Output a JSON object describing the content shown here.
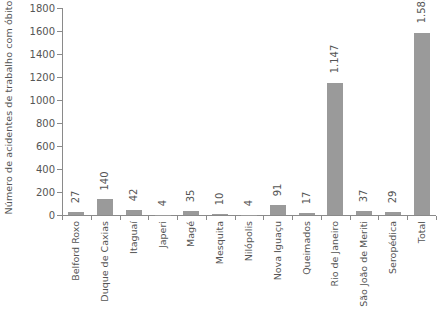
{
  "chart_data": {
    "type": "bar",
    "title": "",
    "xlabel": "",
    "ylabel": "Número de acidentes de trabalho com óbito",
    "ylim": [
      0,
      1800
    ],
    "ytick_step": 200,
    "yticks": [
      1800,
      1600,
      1400,
      1200,
      1000,
      800,
      600,
      400,
      200,
      0
    ],
    "ytick_labels": [
      "1800",
      "1600",
      "1400",
      "1200",
      "1000",
      "800",
      "600",
      "400",
      "200",
      "0"
    ],
    "grid": false,
    "legend": "none",
    "bar_color": "#9a9a9a",
    "axis_color": "#8a8a8a",
    "text_color": "#555555",
    "value_label_rotation": -90,
    "category_label_rotation": -90,
    "categories": [
      "Belford Roxo",
      "Duque de Caxias",
      "Itaguaí",
      "Japeri",
      "Magé",
      "Mesquita",
      "Nilópolis",
      "Nova Iguaçu",
      "Queimados",
      "Rio de Janeiro",
      "São João de Meriti",
      "Seropédica",
      "Total"
    ],
    "values": [
      27,
      140,
      42,
      4,
      35,
      10,
      4,
      91,
      17,
      1147,
      37,
      29,
      1583
    ],
    "value_labels": [
      "27",
      "140",
      "42",
      "4",
      "35",
      "10",
      "4",
      "91",
      "17",
      "1.147",
      "37",
      "29",
      "1.583"
    ]
  }
}
